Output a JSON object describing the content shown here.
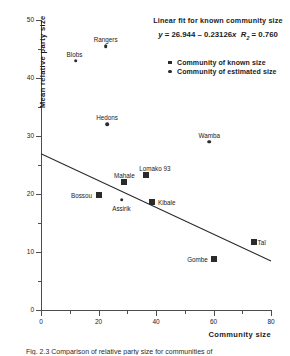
{
  "chart_data": {
    "type": "scatter",
    "title": "",
    "xlabel": "Community size",
    "ylabel": "Mean relative party size",
    "xlim": [
      0,
      80
    ],
    "ylim": [
      0,
      50
    ],
    "xticks": [
      0,
      20,
      40,
      60,
      80
    ],
    "xticks_minor": [
      10,
      30,
      50,
      70
    ],
    "yticks": [
      0,
      10,
      20,
      30,
      40,
      50
    ],
    "yticks_minor": [
      5,
      15,
      25,
      35,
      45
    ],
    "grid": false,
    "legend_position": "upper right",
    "series": [
      {
        "name": "Community of known size",
        "marker": "square",
        "points": [
          {
            "label": "Mahale",
            "x": 29.0,
            "y": 22.1,
            "label_dx": 0,
            "label_dy": -7
          },
          {
            "label": "Lomako 93",
            "x": 36.5,
            "y": 23.3,
            "label_dx": 9,
            "label_dy": -7
          },
          {
            "label": "Bossou",
            "x": 20.0,
            "y": 19.8,
            "label_dx": -17,
            "label_dy": 0
          },
          {
            "label": "Kibale",
            "x": 38.5,
            "y": 18.7,
            "label_dx": 15,
            "label_dy": 0
          },
          {
            "label": "Gombe",
            "x": 60.0,
            "y": 8.8,
            "label_dx": -16,
            "label_dy": 0
          },
          {
            "label": "Taï",
            "x": 74.0,
            "y": 11.8,
            "label_dx": 8,
            "label_dy": 0
          }
        ]
      },
      {
        "name": "Community of estimated size",
        "marker": "circle",
        "points": [
          {
            "label": "Blobs",
            "x": 12.0,
            "y": 43.0,
            "label_dx": -1,
            "label_dy": -7
          },
          {
            "label": "Rangers",
            "x": 22.5,
            "y": 45.5,
            "label_dx": 0,
            "label_dy": -7
          },
          {
            "label": "Hedons",
            "x": 23.0,
            "y": 32.0,
            "label_dx": 0,
            "label_dy": -7
          },
          {
            "label": "Wamba",
            "x": 58.5,
            "y": 29.0,
            "label_dx": 0,
            "label_dy": -7
          },
          {
            "label": "Assirik",
            "x": 28.0,
            "y": 19.0,
            "label_dx": 0,
            "label_dy": 8
          }
        ]
      }
    ],
    "fit": {
      "title": "Linear fit for known community size",
      "equation_text": "y = 26.944 – 0.23126x  R₂ = 0.760",
      "equation_lhs": "y",
      "equation_eq": " = 26.944 – 0.23126",
      "equation_var": "x",
      "equation_r_symbol": "R",
      "equation_r_sub": "2",
      "equation_r_value": " = 0.760",
      "intercept": 26.944,
      "slope": -0.23126,
      "r_squared": 0.76,
      "x_start": 0,
      "x_end": 80
    }
  },
  "legend": {
    "items": [
      {
        "marker": "square",
        "label": "Community of known size"
      },
      {
        "marker": "circle",
        "label": "Community of estimated size"
      }
    ]
  },
  "caption": {
    "text": "Fig. 2.3  Comparison of relative party size for communities of"
  }
}
